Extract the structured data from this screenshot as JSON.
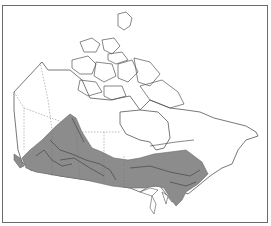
{
  "map": {
    "region": "Canada",
    "description": "Distribution range map",
    "colors": {
      "background": "#ffffff",
      "outline": "#555555",
      "range_fill": "#8c8c8c",
      "rivers": "#3a3a3a",
      "border": "#6a6a6a"
    }
  }
}
